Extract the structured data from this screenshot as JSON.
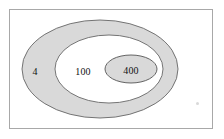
{
  "figure": {
    "type": "concentric-ellipse-diagram",
    "frame": {
      "visible": true,
      "border_color": "#a8a8a8"
    },
    "colors": {
      "shaded_fill": "#d9d9d9",
      "unshaded_fill": "#ffffff",
      "stroke": "#555555",
      "text": "#111111",
      "background": "#ffffff"
    },
    "regions": [
      {
        "name": "outer-ring",
        "label": "4",
        "shaded": true,
        "fill": "#d9d9d9"
      },
      {
        "name": "middle-ring",
        "label": "100",
        "shaded": false,
        "fill": "#ffffff"
      },
      {
        "name": "inner-region",
        "label": "400",
        "shaded": true,
        "fill": "#d9d9d9"
      }
    ],
    "ellipses": [
      {
        "name": "outer-ellipse",
        "cx": 100,
        "cy": 69,
        "rx": 78,
        "ry": 49
      },
      {
        "name": "middle-ellipse",
        "cx": 109,
        "cy": 69,
        "rx": 54,
        "ry": 34
      },
      {
        "name": "inner-ellipse",
        "cx": 131,
        "cy": 69,
        "rx": 26,
        "ry": 14
      }
    ]
  }
}
